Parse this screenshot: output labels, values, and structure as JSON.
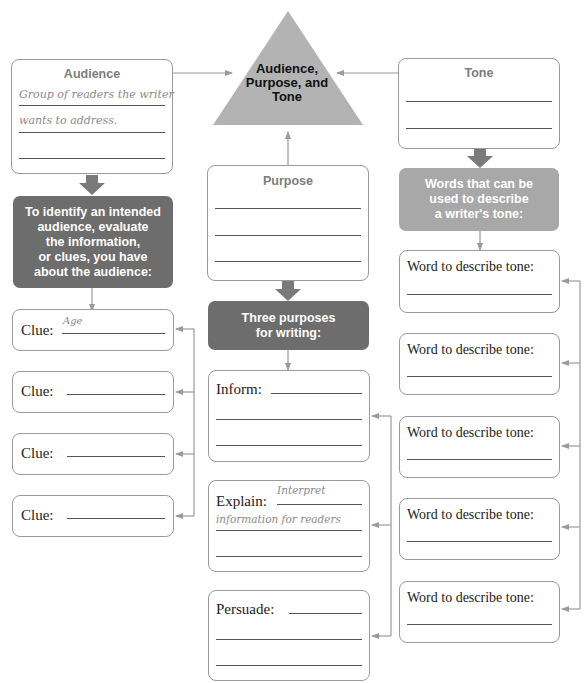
{
  "center": {
    "title": "Audience, Purpose, and Tone",
    "lines": [
      "Audience,",
      "Purpose, and",
      "Tone"
    ]
  },
  "audience": {
    "title": "Audience",
    "answer_line1": "Group of readers the writer",
    "answer_line2": "wants to address.",
    "answer_line3": ""
  },
  "audience_prompt": {
    "lines": [
      "To identify an intended",
      "audience, evaluate",
      "the information,",
      "or clues, you have",
      "about the audience:"
    ]
  },
  "clues": [
    {
      "label": "Clue:",
      "value": "Age"
    },
    {
      "label": "Clue:",
      "value": ""
    },
    {
      "label": "Clue:",
      "value": ""
    },
    {
      "label": "Clue:",
      "value": ""
    }
  ],
  "purpose": {
    "title": "Purpose",
    "answers": [
      "",
      "",
      ""
    ]
  },
  "purpose_prompt": {
    "lines": [
      "Three purposes",
      "for writing:"
    ]
  },
  "purposes": [
    {
      "label": "Inform:",
      "value_line1": "",
      "value_line2": "",
      "value_line3": ""
    },
    {
      "label": "Explain:",
      "value_line1": "Interpret",
      "value_line2": "information for readers",
      "value_line3": ""
    },
    {
      "label": "Persuade:",
      "value_line1": "",
      "value_line2": "",
      "value_line3": ""
    }
  ],
  "tone": {
    "title": "Tone",
    "answers": [
      "",
      ""
    ]
  },
  "tone_prompt": {
    "lines": [
      "Words that can be",
      "used to describe",
      "a writer's tone:"
    ]
  },
  "tone_words": [
    {
      "label": "Word to describe tone:",
      "value": ""
    },
    {
      "label": "Word to describe tone:",
      "value": ""
    },
    {
      "label": "Word to describe tone:",
      "value": ""
    },
    {
      "label": "Word to describe tone:",
      "value": ""
    },
    {
      "label": "Word to describe tone:",
      "value": ""
    }
  ],
  "colors": {
    "triangle": "#b3b3b3",
    "dark_box": "#6d6d6d",
    "mid_box": "#a8a8a8",
    "connector": "#9a9a9a",
    "title_text": "#7d7d7d"
  }
}
